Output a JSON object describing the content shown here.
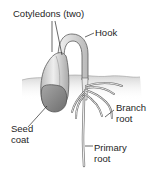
{
  "diagram": {
    "labels": {
      "cotyledons": "Cotyledons (two)",
      "hook": "Hook",
      "branch_root_line1": "Branch",
      "branch_root_line2": "root",
      "seed_coat_line1": "Seed",
      "seed_coat_line2": "coat",
      "primary_root_line1": "Primary",
      "primary_root_line2": "root"
    },
    "colors": {
      "background": "#ffffff",
      "outline": "#5a5a5a",
      "fill_light": "#e4e4e4",
      "fill_mid": "#b9b9b9",
      "seed_coat": "#8f8f8f",
      "soil": "#d6d6d6",
      "text": "#1e1e1e"
    }
  }
}
